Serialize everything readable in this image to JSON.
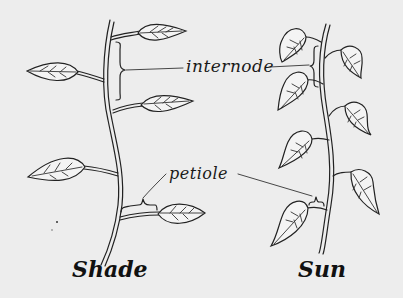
{
  "diagram": {
    "background": "#ededed",
    "ink": "#222222",
    "labels": {
      "internode": "internode",
      "petiole": "petiole"
    },
    "captions": {
      "shade": "Shade",
      "sun": "Sun"
    },
    "plants": [
      {
        "name": "Shade",
        "leaves": 5,
        "internode": "long",
        "petiole": "long"
      },
      {
        "name": "Sun",
        "leaves": 7,
        "internode": "short",
        "petiole": "short"
      }
    ]
  }
}
